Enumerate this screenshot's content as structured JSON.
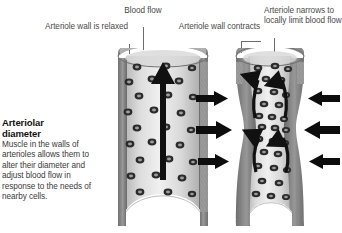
{
  "figure": {
    "background_color": "#ffffff",
    "caption": {
      "title_line1": "Arteriolar",
      "title_line2": "diameter",
      "body": "Muscle in the walls of arterioles allows them to alter their diameter and adjust blood flow in response to the needs of nearby cells."
    },
    "labels": {
      "relaxed": "Arteriole wall is relaxed",
      "blood_flow": "Blood flow",
      "contracts": "Arteriole wall contracts",
      "narrows": "Arteriole narrows to locally limit blood flow"
    },
    "panels": [
      {
        "name": "dilated-arteriole",
        "state": "relaxed",
        "flow_arrow": "single-upward-arrow",
        "nuclei_count": 22
      },
      {
        "name": "constricted-arteriole",
        "state": "contracted",
        "flow_arrow": "four-converging-curved-arrows",
        "compression_arrows_left": 3,
        "compression_arrows_right": 3,
        "nuclei_count": 26
      }
    ],
    "colors": {
      "wall": "#8a8a8a",
      "lumen": "#e8e8e8",
      "nucleus": "#2e2e2e",
      "arrow": "#111111",
      "label_text": "#4a4a4a",
      "title_text": "#111111"
    }
  }
}
